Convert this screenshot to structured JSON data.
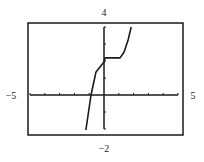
{
  "chart_data": {
    "type": "line",
    "title": "",
    "xlabel": "",
    "ylabel": "",
    "xlim": [
      -5,
      5
    ],
    "ylim": [
      -2,
      4
    ],
    "x_tick_step": 1,
    "y_tick_step": 1,
    "grid": false,
    "legend": null,
    "window_labels": {
      "ymax": "4",
      "ymin": "−2",
      "xmin": "−5",
      "xmax": "5"
    },
    "series": [
      {
        "name": "f(x)",
        "x": [
          -1.22,
          -0.88,
          -0.54,
          0,
          0.07,
          1.09,
          1.36,
          1.63,
          1.84
        ],
        "y": [
          -2.06,
          0,
          1.35,
          1.94,
          2.18,
          2.18,
          2.53,
          3.24,
          4
        ]
      }
    ]
  },
  "colors": {
    "frame": "#1a1a1a",
    "axis": "#1a1a1a",
    "curve": "#1a1a1a",
    "background": "#ffffff"
  }
}
